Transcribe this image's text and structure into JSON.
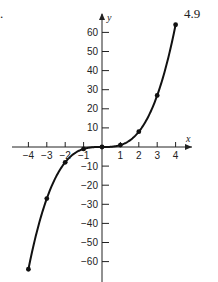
{
  "figure": {
    "number": "4.9",
    "left_mark": "."
  },
  "chart_data": {
    "type": "line",
    "title": "",
    "xlabel": "x",
    "ylabel": "y",
    "x": [
      -4,
      -3,
      -2,
      -1,
      0,
      1,
      2,
      3,
      4
    ],
    "series": [
      {
        "name": "y = x^3",
        "values": [
          -64,
          -27,
          -8,
          -1,
          0,
          1,
          8,
          27,
          64
        ]
      }
    ],
    "x_ticks": [
      -4,
      -3,
      -2,
      -1,
      1,
      2,
      3,
      4
    ],
    "x_tick_labels": [
      "−4",
      "−3",
      "−2",
      "−1",
      "1",
      "2",
      "3",
      "4"
    ],
    "y_ticks": [
      60,
      50,
      40,
      30,
      20,
      10,
      -10,
      -20,
      -30,
      -40,
      -50,
      -60
    ],
    "y_tick_labels": [
      "60",
      "50",
      "40",
      "30",
      "20",
      "10",
      "−10",
      "−20",
      "−30",
      "−40",
      "−50",
      "−60"
    ],
    "xlim": [
      -4.5,
      4.5
    ],
    "ylim": [
      -70,
      70
    ],
    "grid": false,
    "legend": null,
    "markers": true
  }
}
